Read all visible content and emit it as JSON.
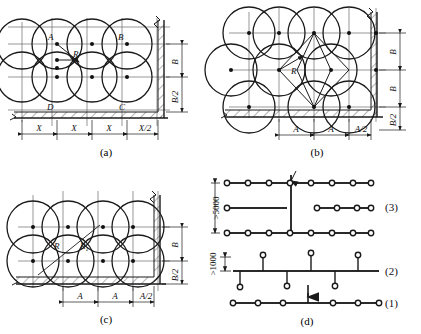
{
  "figure": {
    "panels": [
      {
        "id": "a",
        "caption": "(a)",
        "description": "Rectangular (square) sprinkler layout with protection circles",
        "point_labels": [
          "A",
          "B",
          "C",
          "D"
        ],
        "radius_labels": [
          "R"
        ],
        "horizontal_dims": [
          "X",
          "X",
          "X",
          "X/2"
        ],
        "vertical_dims": [
          "B",
          "B/2"
        ],
        "columns": 4,
        "rows": 2
      },
      {
        "id": "b",
        "caption": "(b)",
        "description": "Staggered (triangular) sprinkler layout with protection circles",
        "point_labels": [],
        "radius_labels": [
          "R"
        ],
        "horizontal_dims": [
          "A",
          "A",
          "A/2"
        ],
        "vertical_dims": [
          "B",
          "B",
          "B/2"
        ],
        "columns": 3,
        "rows": 3
      },
      {
        "id": "c",
        "caption": "(c)",
        "description": "Rectangular sprinkler layout with two radii R and R1",
        "point_labels": [],
        "radius_labels": [
          "R",
          "R",
          "1"
        ],
        "horizontal_dims": [
          "A",
          "A",
          "A/2"
        ],
        "vertical_dims": [
          "B",
          "B/2"
        ],
        "columns": 3,
        "rows": 2
      },
      {
        "id": "d",
        "caption": "(d)",
        "description": "Sprinkler branch pipe arrangements, three schemes",
        "row_labels": [
          "(3)",
          "(2)",
          "(1)"
        ],
        "dims": [
          ">5000",
          ">1000"
        ],
        "scheme3_rows": 3,
        "scheme3_heads_per_row": 8,
        "scheme2_heads": 8,
        "scheme1_heads": 7
      }
    ]
  },
  "colors": {
    "ink": "#1a1a1a",
    "grid": "#6b6b6b",
    "hatch": "#3a3a3a",
    "paper": "#ffffff"
  }
}
